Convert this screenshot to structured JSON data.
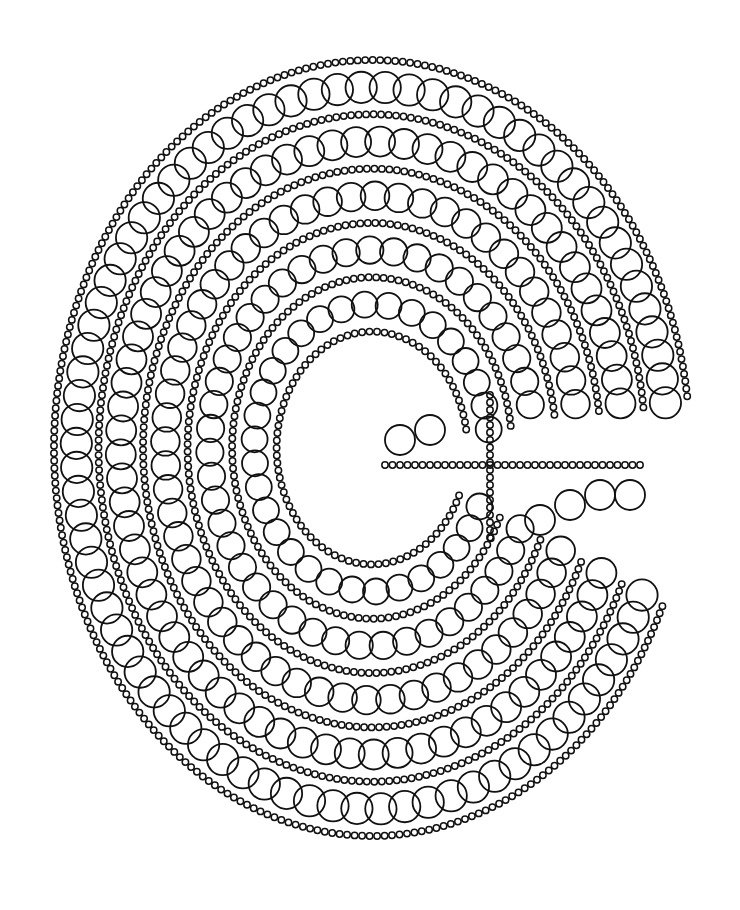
{
  "artwork": {
    "subject": "kidney-shaped labyrinth of chained rings separated by bead strands",
    "background": "#ffffff",
    "ink": "#111111",
    "center": [
      380,
      460
    ],
    "bounding_box": [
      20,
      55,
      690,
      830
    ],
    "ring_bands": [
      {
        "name": "band-outer-1",
        "offset": 0
      },
      {
        "name": "band-2",
        "offset": 1
      },
      {
        "name": "band-3",
        "offset": 2
      },
      {
        "name": "band-4",
        "offset": 3
      },
      {
        "name": "band-5",
        "offset": 4
      },
      {
        "name": "band-inner",
        "offset": 5
      }
    ],
    "cross_junction": [
      490,
      465
    ]
  }
}
